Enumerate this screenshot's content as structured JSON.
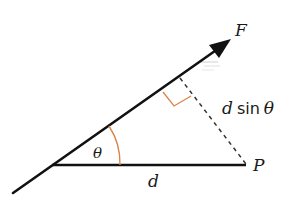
{
  "diagram": {
    "labels": {
      "force": "F",
      "point": "P",
      "distance": "d",
      "angle": "θ",
      "perpendicular_d": "d",
      "perpendicular_sin": "sin",
      "perpendicular_theta": "θ"
    },
    "colors": {
      "line": "#111111",
      "accent": "#d9844a",
      "dashed": "#333333",
      "background": "#ffffff"
    }
  }
}
